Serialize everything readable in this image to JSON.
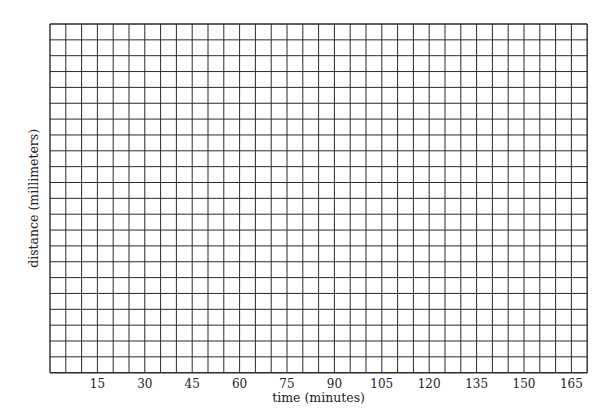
{
  "chart_data": {
    "type": "line",
    "title": "",
    "xlabel": "time (minutes)",
    "ylabel": "distance (millimeters)",
    "x_ticks": [
      15,
      30,
      45,
      60,
      75,
      90,
      105,
      120,
      135,
      150,
      165
    ],
    "y_ticks": [],
    "xlim": [
      0,
      170
    ],
    "grid": true,
    "grid_columns": 34,
    "grid_rows": 22,
    "series": []
  },
  "layout": {
    "left": 50,
    "top": 24,
    "cell_w": 15.8,
    "cell_h": 15.85,
    "minutes_per_column": 5,
    "grid_color": "#2a2a2a"
  }
}
